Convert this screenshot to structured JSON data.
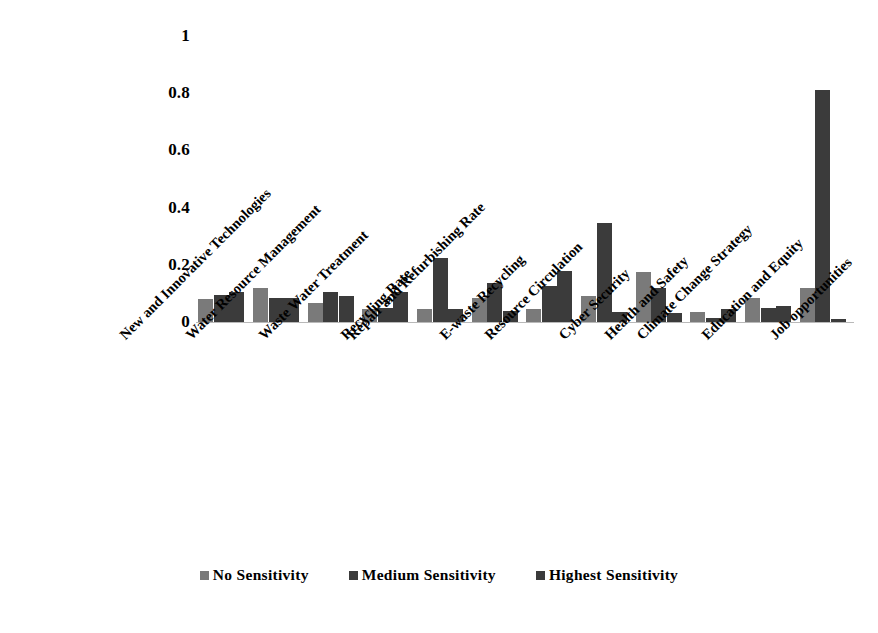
{
  "chart_data": {
    "type": "bar",
    "title": "",
    "subtitle": "",
    "xlabel": "",
    "ylabel": "",
    "ylim": [
      0,
      1
    ],
    "ytick_labels": [
      "0",
      "0.2",
      "0.4",
      "0.6",
      "0.8",
      "1"
    ],
    "ytick_values": [
      0,
      0.2,
      0.4,
      0.6,
      0.8,
      1
    ],
    "grid": false,
    "legend_position": "bottom",
    "categories": [
      "New and Innovative Technologies",
      "Water Resource Management",
      "Waste Water Treatment",
      "Recycling Rate",
      "Repair and Refurbishing Rate",
      "E-waste Recycling",
      "Resource Circulation",
      "Cyber Security",
      "Health and Safety",
      "Climate Change Strategy",
      "Education and Equity",
      "Job opportunities"
    ],
    "series": [
      {
        "name": "No Sensitivity",
        "color": "#7a7a7a",
        "values": [
          0.08,
          0.12,
          0.065,
          0.045,
          0.045,
          0.085,
          0.045,
          0.09,
          0.175,
          0.035,
          0.085,
          0.12
        ]
      },
      {
        "name": "Medium Sensitivity",
        "color": "#3b3b3b",
        "values": [
          0.095,
          0.085,
          0.105,
          0.05,
          0.225,
          0.135,
          0.125,
          0.345,
          0.12,
          0.015,
          0.05,
          0.81
        ]
      },
      {
        "name": "Highest Sensitivity",
        "color": "#3b3b3b",
        "values": [
          0.105,
          0.085,
          0.09,
          0.105,
          0.045,
          0.04,
          0.18,
          0.035,
          0.03,
          0.045,
          0.055,
          0.01
        ]
      }
    ]
  },
  "legend": {
    "items": [
      {
        "label": "No Sensitivity",
        "color": "#7a7a7a"
      },
      {
        "label": "Medium Sensitivity",
        "color": "#3b3b3b"
      },
      {
        "label": "Highest Sensitivity",
        "color": "#3b3b3b"
      }
    ]
  },
  "colors": {
    "no_sensitivity": "#7a7a7a",
    "medium_sensitivity": "#3b3b3b",
    "highest_sensitivity": "#3b3b3b",
    "axis_line": "#b9b9b9",
    "text": "#000000",
    "background": "#ffffff"
  }
}
